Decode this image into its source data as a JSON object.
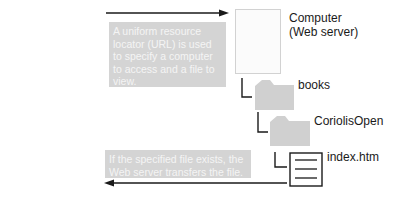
{
  "diagram": {
    "request_callout": "A uniform resource locator (URL) is used to specify a computer to access and a file to view.",
    "response_callout": "If the specified file exists, the Web server transfers the file.",
    "nodes": [
      {
        "label": "Computer\n(Web server)",
        "icon": "server-icon"
      },
      {
        "label": "books",
        "icon": "folder-icon"
      },
      {
        "label": "CoriolisOpen",
        "icon": "folder-icon"
      },
      {
        "label": "index.htm",
        "icon": "document-icon"
      }
    ],
    "computer_label_line1": "Computer",
    "computer_label_line2": "(Web server)",
    "folder1_label": "books",
    "folder2_label": "CoriolisOpen",
    "file_label": "index.htm",
    "colors": {
      "callout_bg": "#d4d4d4",
      "callout_text": "#f4f4f4",
      "folder": "#d0d0d0",
      "line": "#1a1a1a"
    }
  }
}
